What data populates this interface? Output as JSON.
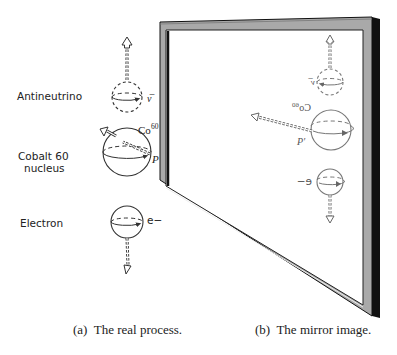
{
  "figure": {
    "left_panel": {
      "labels": {
        "antineutrino": "Antineutrino",
        "cobalt_line1": "Cobalt 60",
        "cobalt_line2": "nucleus",
        "electron": "Electron"
      },
      "symbols": {
        "antineutrino": "ν̅",
        "cobalt": "Co",
        "cobalt_sup": "60",
        "point": "P",
        "electron": "e−"
      },
      "caption": "(a)  The real process."
    },
    "right_panel": {
      "symbols": {
        "antineutrino": "ν̅",
        "cobalt": "Co",
        "cobalt_sup": "60",
        "point": "P′",
        "electron": "e−"
      },
      "caption": "(b)  The mirror image."
    },
    "colors": {
      "frame_face": "#a9a9a9",
      "frame_edge": "#111111",
      "line": "#333333",
      "mirror_line": "#666666",
      "background": "#ffffff"
    }
  }
}
